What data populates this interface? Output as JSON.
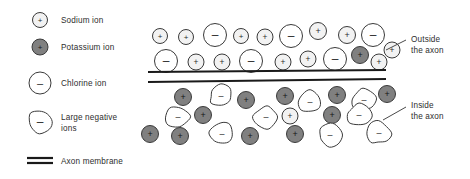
{
  "diagram": {
    "title_present": false,
    "colors": {
      "sodium_fill": "#f2f2f2",
      "sodium_stroke": "#3a3a3a",
      "potassium_fill": "#808080",
      "potassium_stroke": "#3a3a3a",
      "chlorine_fill": "#ffffff",
      "chlorine_stroke": "#3a3a3a",
      "large_negative_fill": "#ffffff",
      "large_negative_stroke": "#3a3a3a",
      "membrane_stroke": "#1a1a1a",
      "text": "#2e2e2e",
      "leader_line": "#4a4a4a"
    },
    "membrane": {
      "label": "Axon membrane",
      "line_count": 2,
      "x_start": 148,
      "x_end": 386,
      "outer_line_y_left": 72,
      "outer_line_y_right": 70,
      "inner_line_y_left": 82,
      "inner_line_y_right": 79
    },
    "legend": {
      "items": [
        {
          "id": "sodium",
          "label": "Sodium ion",
          "sign": "+",
          "shape": "circle",
          "fill": "#f2f2f2",
          "radius": 7.5,
          "cx": 40,
          "cy": 20
        },
        {
          "id": "potassium",
          "label": "Potassium ion",
          "sign": "+",
          "shape": "circle",
          "fill": "#808080",
          "radius": 8,
          "cx": 40,
          "cy": 47
        },
        {
          "id": "chlorine",
          "label": "Chlorine ion",
          "sign": "–",
          "shape": "circle",
          "fill": "#ffffff",
          "radius": 11,
          "cx": 40,
          "cy": 83
        },
        {
          "id": "large-negative",
          "label": "Large negative ions",
          "label_line_1": "Large negative",
          "label_line_2": "ions",
          "sign": "–",
          "shape": "blob",
          "fill": "#ffffff",
          "radius": 12,
          "cx": 40,
          "cy": 122
        },
        {
          "id": "axon-membrane",
          "label": "Axon membrane",
          "sign": "",
          "shape": "double-line",
          "cx": 40,
          "cy": 161
        }
      ],
      "text_x": 61
    },
    "callouts": [
      {
        "id": "outside-the-axon",
        "line_1": "Outside",
        "line_2": "the axon",
        "text_x": 411,
        "text_y_1": 42,
        "text_y_2": 53,
        "leader": {
          "x1": 386,
          "y1": 50,
          "x2": 406,
          "y2": 40
        }
      },
      {
        "id": "inside-the-axon",
        "line_1": "Inside",
        "line_2": "the axon",
        "text_x": 411,
        "text_y_1": 108,
        "text_y_2": 119,
        "leader": {
          "x1": 383,
          "y1": 120,
          "x2": 406,
          "y2": 107
        }
      }
    ],
    "outside_ions": [
      {
        "type": "sodium",
        "sign": "+",
        "cx": 160,
        "cy": 36,
        "r": 7.5
      },
      {
        "type": "sodium",
        "sign": "+",
        "cx": 186,
        "cy": 37,
        "r": 7.5
      },
      {
        "type": "chlorine",
        "sign": "–",
        "cx": 215,
        "cy": 35,
        "r": 11.5
      },
      {
        "type": "sodium",
        "sign": "+",
        "cx": 241,
        "cy": 36,
        "r": 7.5
      },
      {
        "type": "sodium",
        "sign": "+",
        "cx": 265,
        "cy": 37,
        "r": 8
      },
      {
        "type": "chlorine",
        "sign": "–",
        "cx": 291,
        "cy": 36,
        "r": 11.5
      },
      {
        "type": "sodium",
        "sign": "+",
        "cx": 318,
        "cy": 31,
        "r": 8.5
      },
      {
        "type": "sodium",
        "sign": "+",
        "cx": 347,
        "cy": 35,
        "r": 8.5
      },
      {
        "type": "chlorine",
        "sign": "–",
        "cx": 373,
        "cy": 35,
        "r": 11.5
      },
      {
        "type": "chlorine",
        "sign": "–",
        "cx": 166,
        "cy": 61,
        "r": 11.5
      },
      {
        "type": "sodium",
        "sign": "+",
        "cx": 196,
        "cy": 62,
        "r": 8
      },
      {
        "type": "sodium",
        "sign": "+",
        "cx": 222,
        "cy": 62,
        "r": 8
      },
      {
        "type": "chlorine",
        "sign": "–",
        "cx": 251,
        "cy": 61,
        "r": 11.5
      },
      {
        "type": "sodium",
        "sign": "+",
        "cx": 283,
        "cy": 62,
        "r": 8
      },
      {
        "type": "sodium",
        "sign": "+",
        "cx": 308,
        "cy": 59,
        "r": 8
      },
      {
        "type": "chlorine",
        "sign": "–",
        "cx": 335,
        "cy": 59,
        "r": 11.5
      },
      {
        "type": "potassium",
        "sign": "+",
        "cx": 360,
        "cy": 55,
        "r": 8.5
      },
      {
        "type": "sodium",
        "sign": "+",
        "cx": 379,
        "cy": 62,
        "r": 8
      },
      {
        "type": "sodium",
        "sign": "+",
        "cx": 392,
        "cy": 50,
        "r": 8
      }
    ],
    "inside_ions": [
      {
        "type": "potassium",
        "sign": "+",
        "cx": 183,
        "cy": 97,
        "r": 8.5
      },
      {
        "type": "large-negative",
        "sign": "–",
        "cx": 221,
        "cy": 96,
        "r": 12
      },
      {
        "type": "potassium",
        "sign": "+",
        "cx": 246,
        "cy": 100,
        "r": 8.5
      },
      {
        "type": "potassium",
        "sign": "+",
        "cx": 285,
        "cy": 96,
        "r": 8.5
      },
      {
        "type": "large-negative",
        "sign": "–",
        "cx": 310,
        "cy": 102,
        "r": 12
      },
      {
        "type": "potassium",
        "sign": "+",
        "cx": 337,
        "cy": 95,
        "r": 8.5
      },
      {
        "type": "large-negative",
        "sign": "–",
        "cx": 364,
        "cy": 100,
        "r": 12
      },
      {
        "type": "potassium",
        "sign": "+",
        "cx": 387,
        "cy": 94,
        "r": 8.5
      },
      {
        "type": "large-negative",
        "sign": "–",
        "cx": 178,
        "cy": 117,
        "r": 12
      },
      {
        "type": "potassium",
        "sign": "+",
        "cx": 203,
        "cy": 115,
        "r": 8.5
      },
      {
        "type": "large-negative",
        "sign": "–",
        "cx": 266,
        "cy": 117,
        "r": 12
      },
      {
        "type": "sodium",
        "sign": "+",
        "cx": 290,
        "cy": 116,
        "r": 8
      },
      {
        "type": "potassium",
        "sign": "+",
        "cx": 332,
        "cy": 115,
        "r": 8.5
      },
      {
        "type": "large-negative",
        "sign": "–",
        "cx": 359,
        "cy": 115,
        "r": 12
      },
      {
        "type": "potassium",
        "sign": "+",
        "cx": 150,
        "cy": 134,
        "r": 8.5
      },
      {
        "type": "potassium",
        "sign": "+",
        "cx": 180,
        "cy": 136,
        "r": 8.5
      },
      {
        "type": "large-negative",
        "sign": "–",
        "cx": 222,
        "cy": 134,
        "r": 12
      },
      {
        "type": "potassium",
        "sign": "+",
        "cx": 250,
        "cy": 136,
        "r": 8.5
      },
      {
        "type": "potassium",
        "sign": "+",
        "cx": 295,
        "cy": 134,
        "r": 8.5
      },
      {
        "type": "large-negative",
        "sign": "–",
        "cx": 330,
        "cy": 135,
        "r": 12
      },
      {
        "type": "large-negative",
        "sign": "–",
        "cx": 379,
        "cy": 133,
        "r": 12
      }
    ]
  }
}
